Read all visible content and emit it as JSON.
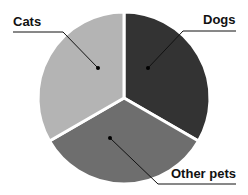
{
  "chart_data": {
    "type": "pie",
    "title": "",
    "slices": [
      {
        "label": "Dogs",
        "value": 33.3,
        "color": "#333333"
      },
      {
        "label": "Other pets",
        "value": 33.3,
        "color": "#6e6e6e"
      },
      {
        "label": "Cats",
        "value": 33.3,
        "color": "#b4b4b4"
      }
    ],
    "start_angle_deg": 0,
    "legend": "callout-labels"
  },
  "labels": {
    "cats": "Cats",
    "dogs": "Dogs",
    "other_pets": "Other pets"
  }
}
